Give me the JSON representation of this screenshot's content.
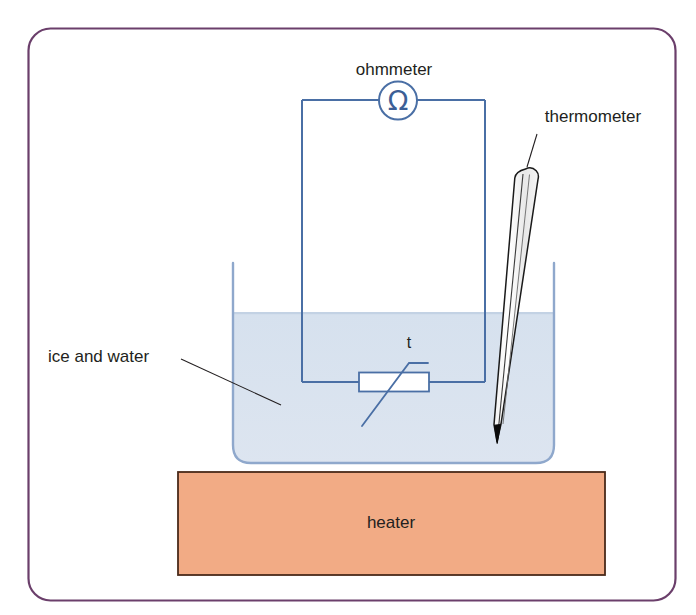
{
  "figure": {
    "frame": {
      "border_color": "#6b3f6b",
      "background_color": "#ffffff"
    }
  },
  "labels": {
    "ohmmeter": "ohmmeter",
    "thermometer": "thermometer",
    "ice_and_water": "ice and water",
    "heater": "heater",
    "thermistor_symbol": "t"
  },
  "components": {
    "ohmmeter": {
      "name": "ohmmeter",
      "symbol": "Ω",
      "icon": "ohmmeter-circle-icon",
      "color": "#4a6fa5"
    },
    "thermistor": {
      "name": "thermistor",
      "label": "t",
      "icon": "thermistor-icon",
      "color": "#4a6fa5"
    },
    "circuit_wires": {
      "name": "circuit loop",
      "color": "#4a6fa5"
    },
    "beaker": {
      "name": "beaker",
      "outline_color": "#8fa8cc"
    },
    "water": {
      "name": "ice and water",
      "fill_color": "#d9e3ef",
      "surface_color": "#c5d4e6"
    },
    "thermometer": {
      "name": "thermometer",
      "body_color": "#ffffff",
      "outline_color": "#1a1a1a",
      "bulb_color": "#000000"
    },
    "heater": {
      "name": "heater",
      "fill_color": "#f2ab85",
      "border_color": "#4a2a1a"
    }
  },
  "colors": {
    "frame_purple": "#6b3f6b",
    "wire_blue": "#4a6fa5",
    "beaker_blue": "#8fa8cc",
    "water_blue": "#d9e3ef",
    "heater_orange": "#f2ab85",
    "heater_border": "#4a2a1a",
    "text_dark": "#231f20"
  }
}
